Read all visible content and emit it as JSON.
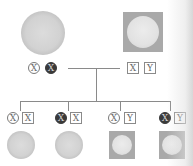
{
  "diagram": {
    "type": "x-linked-inheritance-pedigree",
    "colors": {
      "line": "#8a8a8a",
      "carrier_fill": "#3a3a3a",
      "shape_gray": "#a9a9a9"
    },
    "parents": {
      "mother": {
        "shape": "circle",
        "sex": "female",
        "chromosomes": [
          {
            "label": "X",
            "style": "circle-normal"
          },
          {
            "label": "X",
            "style": "circle-carrier"
          }
        ]
      },
      "father": {
        "shape": "square",
        "sex": "male",
        "chromosomes": [
          {
            "label": "X",
            "style": "box"
          },
          {
            "label": "Y",
            "style": "box"
          }
        ]
      }
    },
    "children": [
      {
        "shape": "circle",
        "sex": "female",
        "chromosomes": [
          {
            "label": "X",
            "style": "circle-normal"
          },
          {
            "label": "X",
            "style": "box"
          }
        ]
      },
      {
        "shape": "circle",
        "sex": "female",
        "chromosomes": [
          {
            "label": "X",
            "style": "circle-carrier"
          },
          {
            "label": "X",
            "style": "box"
          }
        ]
      },
      {
        "shape": "square",
        "sex": "male",
        "chromosomes": [
          {
            "label": "X",
            "style": "circle-normal"
          },
          {
            "label": "Y",
            "style": "box"
          }
        ]
      },
      {
        "shape": "square",
        "sex": "male",
        "chromosomes": [
          {
            "label": "X",
            "style": "circle-carrier"
          },
          {
            "label": "Y",
            "style": "box"
          }
        ]
      }
    ]
  }
}
